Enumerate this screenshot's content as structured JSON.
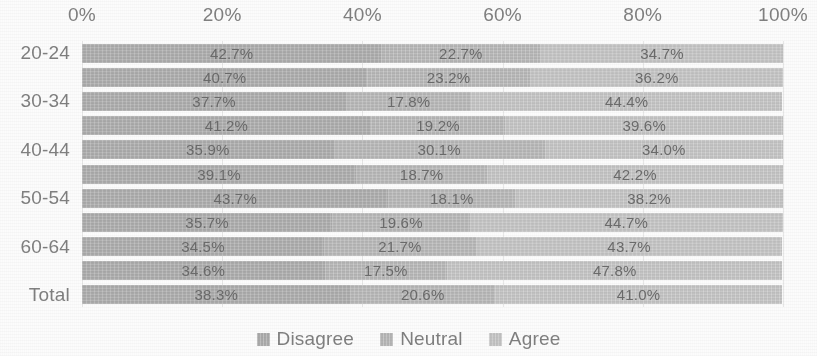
{
  "chart_data": {
    "type": "bar",
    "subtype": "100% stacked horizontal bar",
    "title": "",
    "xlabel": "",
    "ylabel": "",
    "xlim": [
      0,
      100
    ],
    "xticks": [
      "0%",
      "20%",
      "40%",
      "60%",
      "80%",
      "100%"
    ],
    "xtick_values": [
      0,
      20,
      40,
      60,
      80,
      100
    ],
    "grid": true,
    "grid_axis": "x",
    "legend_position": "bottom-center",
    "categories": [
      "20-24",
      "",
      "30-34",
      "",
      "40-44",
      "",
      "50-54",
      "",
      "60-64",
      "",
      "Total"
    ],
    "series": [
      {
        "name": "Disagree",
        "color": "#a9a9a9",
        "values": [
          42.7,
          40.7,
          37.7,
          41.2,
          35.9,
          39.1,
          43.7,
          35.7,
          34.5,
          34.6,
          38.3
        ],
        "labels": [
          "42.7%",
          "40.7%",
          "37.7%",
          "41.2%",
          "35.9%",
          "39.1%",
          "43.7%",
          "35.7%",
          "34.5%",
          "34.6%",
          "38.3%"
        ]
      },
      {
        "name": "Neutral",
        "color": "#b4b4b4",
        "values": [
          22.7,
          23.2,
          17.8,
          19.2,
          30.1,
          18.7,
          18.1,
          19.6,
          21.7,
          17.5,
          20.6
        ],
        "labels": [
          "22.7%",
          "23.2%",
          "17.8%",
          "19.2%",
          "30.1%",
          "18.7%",
          "18.1%",
          "19.6%",
          "21.7%",
          "17.5%",
          "20.6%"
        ]
      },
      {
        "name": "Agree",
        "color": "#c1c1c1",
        "values": [
          34.7,
          36.2,
          44.4,
          39.6,
          34.0,
          42.2,
          38.2,
          44.7,
          43.7,
          47.8,
          41.0
        ],
        "labels": [
          "34.7%",
          "36.2%",
          "44.4%",
          "39.6%",
          "34.0%",
          "42.2%",
          "38.2%",
          "44.7%",
          "43.7%",
          "47.8%",
          "41.0%"
        ]
      }
    ]
  },
  "legend": {
    "items": [
      {
        "label": "Disagree",
        "series": "disagree"
      },
      {
        "label": "Neutral",
        "series": "neutral"
      },
      {
        "label": "Agree",
        "series": "agree"
      }
    ]
  }
}
